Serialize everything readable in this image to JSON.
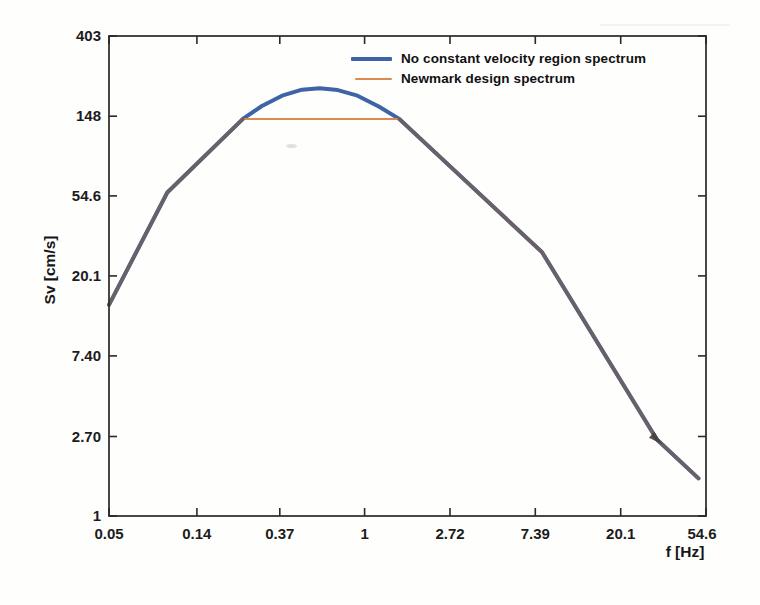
{
  "figure": {
    "background": "#fefefd",
    "axis_color": "#2b2826"
  },
  "legend": {
    "items": [
      {
        "label": "No constant velocity region spectrum",
        "color": "#3f63a7",
        "line_weight": "thick"
      },
      {
        "label": "Newmark design spectrum",
        "color": "#dd8a50",
        "line_weight": "thin"
      }
    ]
  },
  "chart_data": {
    "type": "line",
    "title": "",
    "xlabel": "f [Hz]",
    "ylabel": "Sv [cm/s]",
    "x_scale": "log-e",
    "y_scale": "log-e",
    "xlim": [
      0.05,
      54.6
    ],
    "ylim": [
      1,
      403
    ],
    "x_ticks": [
      0.05,
      0.14,
      0.37,
      1,
      2.72,
      7.39,
      20.1,
      54.6
    ],
    "x_tick_labels": [
      "0.05",
      "0.14",
      "0.37",
      "1",
      "2.72",
      "7.39",
      "20.1",
      "54.6"
    ],
    "y_ticks": [
      1,
      2.7,
      7.4,
      20.1,
      54.6,
      148,
      403
    ],
    "y_tick_labels": [
      "1",
      "2.70",
      "7.40",
      "20.1",
      "54.6",
      "148",
      "403"
    ],
    "grid": false,
    "legend_position": "top-right-inside",
    "series": [
      {
        "name": "No constant velocity region spectrum",
        "color": "#3f63a7",
        "width": 4,
        "points": [
          [
            0.05,
            14
          ],
          [
            0.099,
            57
          ],
          [
            0.24,
            143
          ],
          [
            0.3,
            168
          ],
          [
            0.38,
            191
          ],
          [
            0.48,
            206
          ],
          [
            0.59,
            210
          ],
          [
            0.73,
            205
          ],
          [
            0.92,
            191
          ],
          [
            1.18,
            167
          ],
          [
            1.5,
            143
          ],
          [
            8,
            27
          ],
          [
            30.7,
            2.6
          ],
          [
            50,
            1.6
          ]
        ]
      },
      {
        "name": "Newmark design spectrum",
        "color": "#dd8a50",
        "width": 2,
        "points": [
          [
            0.05,
            14
          ],
          [
            0.099,
            57
          ],
          [
            0.24,
            143
          ],
          [
            1.5,
            143
          ],
          [
            8,
            27
          ],
          [
            30.7,
            2.6
          ],
          [
            50,
            1.6
          ]
        ]
      }
    ],
    "overlap_segments": [
      {
        "color": "#6c6064",
        "width": 3.5,
        "points": [
          [
            0.05,
            14
          ],
          [
            0.099,
            57
          ],
          [
            0.24,
            143
          ]
        ]
      },
      {
        "color": "#6c6064",
        "width": 3.5,
        "points": [
          [
            1.5,
            143
          ],
          [
            8,
            27
          ],
          [
            30.7,
            2.6
          ],
          [
            50,
            1.6
          ]
        ]
      }
    ],
    "marker": {
      "f": 30.7,
      "sv": 2.6,
      "shape": "arrowhead",
      "color": "#4a4043"
    }
  }
}
